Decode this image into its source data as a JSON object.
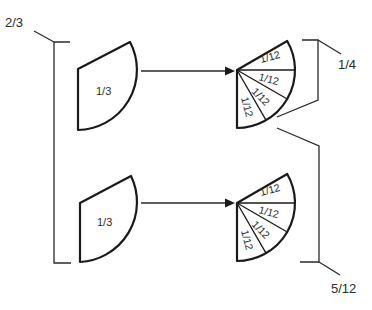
{
  "diagram": {
    "left_group": {
      "label": "2/3",
      "pieces": [
        {
          "label": "1/3"
        },
        {
          "label": "1/3"
        }
      ]
    },
    "top_fan": {
      "slices": [
        {
          "label": "1/12"
        },
        {
          "label": "1/12"
        },
        {
          "label": "1/12"
        },
        {
          "label": "1/12"
        }
      ]
    },
    "bottom_fan": {
      "slices": [
        {
          "label": "1/12"
        },
        {
          "label": "1/12"
        },
        {
          "label": "1/12"
        },
        {
          "label": "1/12"
        }
      ]
    },
    "right_top_bracket": {
      "label": "1/4"
    },
    "right_bottom_bracket": {
      "label": "5/12"
    },
    "colors": {
      "stroke": "#1a1a1a",
      "background": "#ffffff"
    }
  }
}
